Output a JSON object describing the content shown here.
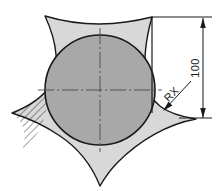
{
  "drawing": {
    "title": "Tri-lobed cam profile with inscribed circle",
    "canvas": {
      "width": 217,
      "height": 191,
      "background": "#ffffff"
    },
    "colors": {
      "outline": "#1a1a1a",
      "outer_fill": "#d8d8d8",
      "circle_fill": "#a8a8a8",
      "hatch": "#1a1a1a",
      "centerline": "#555555",
      "dimension": "#1a1a1a"
    },
    "circle": {
      "label": "inscribed-circle",
      "cx": 100,
      "cy": 90,
      "r": 55,
      "fill": "#a8a8a8"
    },
    "centerlines": {
      "horizontal": {
        "x1": 38,
        "y1": 90,
        "x2": 162,
        "y2": 90
      },
      "vertical": {
        "x1": 100,
        "y1": 28,
        "x2": 100,
        "y2": 152
      }
    },
    "outer_profile": {
      "label": "tri-lobe-spiked-profile",
      "fill": "#d8d8d8",
      "spike_tips": [
        {
          "name": "top-left-spike",
          "x": 45,
          "y": 16
        },
        {
          "name": "left-spike",
          "x": 12,
          "y": 113
        },
        {
          "name": "bottom-spike",
          "x": 100,
          "y": 186
        },
        {
          "name": "right-spike",
          "x": 196,
          "y": 119
        },
        {
          "name": "top-right-spike",
          "x": 152,
          "y": 17
        }
      ]
    },
    "hatching": {
      "label": "section-hatch-left-lobe",
      "angle_deg": 45,
      "spacing_px": 5,
      "color": "#1a1a1a"
    },
    "dimensions": [
      {
        "name": "overall-height-dimension",
        "value": "100",
        "orientation": "vertical",
        "rotation_deg": -90,
        "line": {
          "x": 203,
          "y1": 18,
          "y2": 118
        },
        "extension_top": {
          "x1": 152,
          "y": 17,
          "x2": 212
        },
        "extension_bottom": {
          "x1": 179,
          "y": 118,
          "x2": 212
        },
        "arrows": [
          "top",
          "bottom"
        ],
        "text_x": 199,
        "text_y": 68
      }
    ],
    "leaders": [
      {
        "name": "radius-leader",
        "label": "RX",
        "rotation_deg": -45,
        "from": {
          "x": 191,
          "y": 81
        },
        "to": {
          "x": 164,
          "y": 110
        },
        "text_x": 172,
        "text_y": 96
      }
    ]
  }
}
